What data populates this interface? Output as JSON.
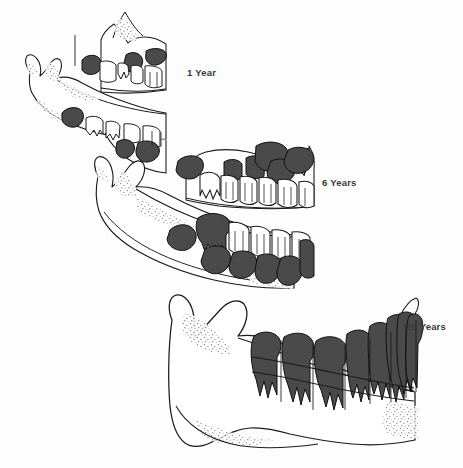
{
  "figure": {
    "type": "anatomical-illustration",
    "background_color": "#fdfdfd",
    "ink_color": "#1a1a1a",
    "tooth_fill_dark": "#4a4a4a",
    "tooth_fill_light": "#ffffff",
    "bone_fill": "#fefefe",
    "stipple_color": "#555555",
    "panels": [
      {
        "id": "panel-1-year",
        "label": "1 Year",
        "label_x": 187,
        "label_y": 67,
        "description": "Infant maxilla and mandible with unerupted deciduous and developing permanent tooth buds",
        "deciduous_teeth_visible": 8,
        "permanent_buds_dark": 7
      },
      {
        "id": "panel-6-years",
        "label": "6 Years",
        "label_x": 322,
        "label_y": 177,
        "description": "Mixed dentition: erupted deciduous teeth in outline with developing permanent teeth shaded dark",
        "deciduous_teeth_visible": 10,
        "permanent_buds_dark": 12
      },
      {
        "id": "panel-25-years",
        "label": "25 Years",
        "label_x": 406,
        "label_y": 321,
        "description": "Adult mandible with complete permanent dentition shaded dark",
        "deciduous_teeth_visible": 0,
        "permanent_buds_dark": 8
      }
    ],
    "legend": {
      "dark_meaning": "permanent teeth",
      "light_meaning": "deciduous (primary) teeth"
    }
  }
}
